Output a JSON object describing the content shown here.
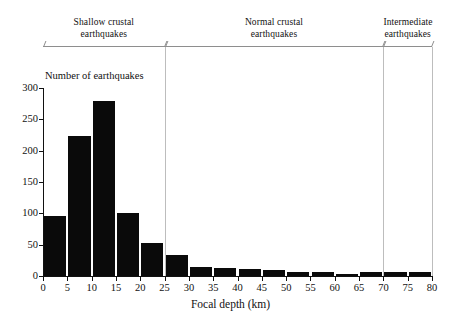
{
  "chart_data": {
    "type": "bar",
    "title": "",
    "xlabel": "Focal depth (km)",
    "ylabel": "Number of earthquakes",
    "categories": [
      "0-5",
      "5-10",
      "10-15",
      "15-20",
      "20-25",
      "25-30",
      "30-35",
      "35-40",
      "40-45",
      "45-50",
      "50-55",
      "55-60",
      "60-65",
      "65-70",
      "70-75",
      "75-80"
    ],
    "bin_starts": [
      0,
      5,
      10,
      15,
      20,
      25,
      30,
      35,
      40,
      45,
      50,
      55,
      60,
      65,
      70,
      75
    ],
    "bin_width": 5,
    "values": [
      96,
      223,
      280,
      100,
      52,
      33,
      14,
      13,
      11,
      9,
      6,
      7,
      4,
      7,
      6,
      7
    ],
    "xlim": [
      0,
      80
    ],
    "ylim": [
      0,
      300
    ],
    "xticks": [
      0,
      5,
      10,
      15,
      20,
      25,
      30,
      35,
      40,
      45,
      50,
      55,
      60,
      65,
      70,
      75,
      80
    ],
    "xtick_labels": [
      "0",
      "5",
      "10",
      "15",
      "20",
      "25",
      "30",
      "35",
      "40",
      "45",
      "50",
      "55",
      "60",
      "65",
      "70",
      "75",
      "80"
    ],
    "yticks": [
      0,
      50,
      100,
      150,
      200,
      250,
      300
    ],
    "ytick_labels": [
      "0",
      "50",
      "100",
      "150",
      "200",
      "250",
      "300"
    ],
    "grid": false,
    "legend": null,
    "bar_color": "#0a0a0a",
    "annotations": [
      {
        "label_line1": "Shallow crustal",
        "label_line2": "earthquakes",
        "from": 0,
        "to": 25
      },
      {
        "label_line1": "Normal crustal",
        "label_line2": "earthquakes",
        "from": 25,
        "to": 70
      },
      {
        "label_line1": "Intermediate",
        "label_line2": "earthquakes",
        "from": 70,
        "to": 80
      }
    ]
  }
}
